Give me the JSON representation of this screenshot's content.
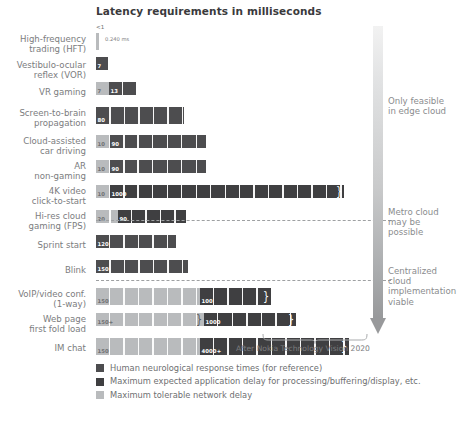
{
  "chart_data": {
    "type": "bar",
    "title": "Latency requirements in milliseconds",
    "xlabel": "",
    "ylabel": "",
    "orientation": "horizontal",
    "stacked": true,
    "grid": false,
    "xlim": [
      0,
      400
    ],
    "footnote": "After Nokia Technology Vision 2020",
    "legend_position": "bottom-left",
    "series": [
      {
        "name": "Human neurological response times (for reference)",
        "key": "neuro",
        "color": "#4d4d4f"
      },
      {
        "name": "Maximum expected application delay for processing/buffering/display, etc.",
        "key": "app",
        "color": "#3f3f41"
      },
      {
        "name": "Maximum tolerable network delay",
        "key": "net",
        "color": "#b9bbbd"
      }
    ],
    "categories": [
      "High-frequency\ntrading (HFT)",
      "Vestibulo-ocular\nreflex (VOR)",
      "VR gaming",
      "Screen-to-brain\npropagation",
      "Cloud-assisted\ncar driving",
      "AR\nnon-gaming",
      "4K video\nclick-to-start",
      "Hi-res cloud\ngaming (FPS)",
      "Sprint start",
      "Blink",
      "VoIP/video conf.\n(1-way)",
      "Web page\nfirst fold load",
      "IM chat"
    ],
    "rows": [
      {
        "label": "High-frequency\ntrading (HFT)",
        "marker": "<1",
        "note": "0.240 ms",
        "segments": [
          {
            "key": "net",
            "value": 1,
            "label": ""
          }
        ]
      },
      {
        "label": "Vestibulo-ocular\nreflex (VOR)",
        "segments": [
          {
            "key": "neuro",
            "value": 7,
            "label": "7"
          }
        ]
      },
      {
        "label": "VR gaming",
        "segments": [
          {
            "key": "net",
            "value": 7,
            "label": "7"
          },
          {
            "key": "neuro",
            "value": 13,
            "label": "13"
          }
        ]
      },
      {
        "label": "Screen-to-brain\npropagation",
        "segments": [
          {
            "key": "neuro",
            "value": 80,
            "label": "80"
          }
        ]
      },
      {
        "label": "Cloud-assisted\ncar driving",
        "segments": [
          {
            "key": "net",
            "value": 10,
            "label": "10"
          },
          {
            "key": "neuro",
            "value": 90,
            "label": "90"
          }
        ]
      },
      {
        "label": "AR\nnon-gaming",
        "segments": [
          {
            "key": "net",
            "value": 10,
            "label": "10"
          },
          {
            "key": "neuro",
            "value": 90,
            "label": "90"
          }
        ]
      },
      {
        "label": "4K video\nclick-to-start",
        "break_end": true,
        "segments": [
          {
            "key": "net",
            "value": 10,
            "label": "10"
          },
          {
            "key": "app",
            "value": 1000,
            "label": "1000"
          }
        ]
      },
      {
        "label": "Hi-res cloud\ngaming (FPS)",
        "segments": [
          {
            "key": "net",
            "value": 20,
            "label": "20"
          },
          {
            "key": "app",
            "value": 90,
            "label": "90"
          }
        ]
      },
      {
        "label": "Sprint start",
        "segments": [
          {
            "key": "neuro",
            "value": 120,
            "label": "120"
          }
        ]
      },
      {
        "label": "Blink",
        "segments": [
          {
            "key": "neuro",
            "value": 150,
            "label": "150"
          }
        ]
      },
      {
        "label": "VoIP/video conf.\n(1-way)",
        "break_end": true,
        "segments": [
          {
            "key": "net",
            "value": 150,
            "label": "150"
          },
          {
            "key": "app",
            "value": 100,
            "label": "100"
          }
        ]
      },
      {
        "label": "Web page\nfirst fold load",
        "break_mid": true,
        "break_end": true,
        "segments": [
          {
            "key": "net",
            "value": 150,
            "label": "150+"
          },
          {
            "key": "app",
            "value": 1000,
            "label": "1000"
          }
        ]
      },
      {
        "label": "IM chat",
        "break_end": true,
        "segments": [
          {
            "key": "net",
            "value": 150,
            "label": "150"
          },
          {
            "key": "app",
            "value": 4000,
            "label": "4000+"
          }
        ]
      }
    ],
    "zones": [
      {
        "text": "Only feasible\nin edge cloud"
      },
      {
        "text": "Metro cloud\nmay be\npossible"
      },
      {
        "text": "Centralized\ncloud\nimplementation\nviable"
      }
    ]
  },
  "legend": {
    "items": [
      {
        "label": "Human neurological response times (for reference)",
        "color": "#4d4d4f"
      },
      {
        "label": "Maximum expected application delay for processing/buffering/display, etc.",
        "color": "#3f3f41"
      },
      {
        "label": "Maximum tolerable network delay",
        "color": "#b9bbbd"
      }
    ]
  }
}
